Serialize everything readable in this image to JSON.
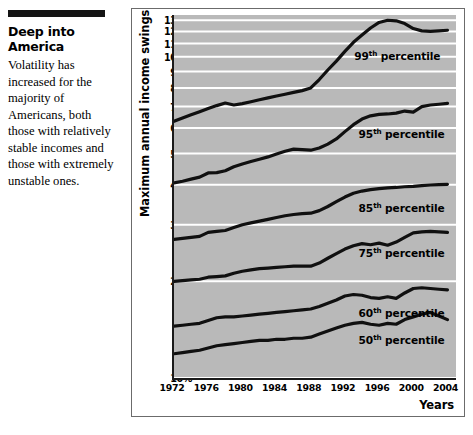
{
  "caption": {
    "heading": "Deep into America",
    "body": "Volatility has increased for the majority of Americans, both those with relatively stable incomes and those with extremely unstable ones."
  },
  "chart_data": {
    "type": "line",
    "title": "",
    "xlabel": "Years",
    "ylabel": "Maximum annual income swings",
    "yscale": "log",
    "ylim": [
      10,
      135
    ],
    "xlim": [
      1972,
      2005
    ],
    "grid": true,
    "legend_position": "inline-on-series",
    "plot_background": "#b9b9b9",
    "line_color": "#101010",
    "gridline_color": "#ffffff",
    "ytick_labels": [
      "130%",
      "120%",
      "110%",
      "100%",
      "90%",
      "80%",
      "70%",
      "60%",
      "50%",
      "40%",
      "30%",
      "20%",
      "10%"
    ],
    "ytick_values": [
      130,
      120,
      110,
      100,
      90,
      80,
      70,
      60,
      50,
      40,
      30,
      20,
      10
    ],
    "xtick_labels": [
      "1972",
      "1976",
      "1980",
      "1984",
      "1988",
      "1992",
      "1996",
      "2000",
      "2004"
    ],
    "xtick_values": [
      1972,
      1976,
      1980,
      1984,
      1988,
      1992,
      1996,
      2000,
      2004
    ],
    "x": [
      1972,
      1973,
      1974,
      1975,
      1976,
      1977,
      1978,
      1979,
      1980,
      1981,
      1982,
      1983,
      1984,
      1985,
      1986,
      1987,
      1988,
      1989,
      1990,
      1991,
      1992,
      1993,
      1994,
      1995,
      1996,
      1997,
      1998,
      1999,
      2000,
      2001,
      2002,
      2003,
      2004
    ],
    "series": [
      {
        "name": "99th percentile",
        "label": "99",
        "label_suffix": "th percentile",
        "label_x_year": 1993.1,
        "label_y_value": 101,
        "values": [
          63.0,
          64.5,
          66.0,
          67.5,
          69.0,
          70.5,
          71.8,
          70.8,
          71.5,
          72.5,
          73.5,
          74.5,
          75.5,
          76.5,
          77.5,
          78.5,
          80.0,
          85.0,
          91.0,
          97.0,
          104.0,
          111.0,
          117.0,
          123.0,
          128.0,
          130.0,
          129.5,
          127.0,
          122.5,
          120.5,
          120.0,
          120.5,
          121.0
        ]
      },
      {
        "name": "95th percentile",
        "label": "95",
        "label_suffix": "th percentile",
        "label_x_year": 1993.6,
        "label_y_value": 57.5,
        "values": [
          40.5,
          41.0,
          41.6,
          42.2,
          43.5,
          43.6,
          44.2,
          45.5,
          46.4,
          47.2,
          48.0,
          48.8,
          49.8,
          50.8,
          51.6,
          51.4,
          51.2,
          52.0,
          53.5,
          55.5,
          58.5,
          61.5,
          64.0,
          65.5,
          66.2,
          66.4,
          66.8,
          67.8,
          67.3,
          70.0,
          70.8,
          71.2,
          71.6
        ]
      },
      {
        "name": "85th percentile",
        "label": "85",
        "label_suffix": "th percentile",
        "label_x_year": 1993.6,
        "label_y_value": 33.8,
        "values": [
          27.0,
          27.2,
          27.4,
          27.6,
          28.4,
          28.6,
          28.8,
          29.4,
          30.0,
          30.4,
          30.8,
          31.2,
          31.6,
          32.0,
          32.3,
          32.5,
          32.6,
          33.2,
          34.2,
          35.4,
          36.6,
          37.6,
          38.2,
          38.6,
          38.9,
          39.1,
          39.2,
          39.4,
          39.5,
          39.7,
          39.9,
          40.0,
          40.1
        ]
      },
      {
        "name": "75th percentile",
        "label": "75",
        "label_suffix": "th percentile",
        "label_x_year": 1993.6,
        "label_y_value": 24.6,
        "values": [
          20.0,
          20.1,
          20.2,
          20.3,
          20.6,
          20.7,
          20.8,
          21.2,
          21.5,
          21.7,
          21.9,
          22.0,
          22.1,
          22.2,
          22.3,
          22.3,
          22.3,
          22.8,
          23.6,
          24.4,
          25.2,
          25.8,
          26.2,
          26.0,
          26.3,
          25.9,
          26.5,
          27.4,
          28.3,
          28.5,
          28.6,
          28.5,
          28.4
        ]
      },
      {
        "name": "60th percentile",
        "label": "60",
        "label_suffix": "th percentile",
        "label_x_year": 1993.6,
        "label_y_value": 15.9,
        "values": [
          14.5,
          14.6,
          14.7,
          14.8,
          15.1,
          15.4,
          15.5,
          15.5,
          15.6,
          15.7,
          15.8,
          15.9,
          16.0,
          16.1,
          16.2,
          16.3,
          16.4,
          16.7,
          17.1,
          17.5,
          18.0,
          18.2,
          18.1,
          17.8,
          17.7,
          17.9,
          17.7,
          18.4,
          19.0,
          19.1,
          19.0,
          18.9,
          18.8
        ]
      },
      {
        "name": "50th percentile",
        "label": "50",
        "label_suffix": "th percentile",
        "label_x_year": 1993.6,
        "label_y_value": 13.1,
        "values": [
          11.9,
          12.0,
          12.1,
          12.2,
          12.4,
          12.6,
          12.7,
          12.8,
          12.9,
          13.0,
          13.1,
          13.1,
          13.2,
          13.2,
          13.3,
          13.3,
          13.4,
          13.7,
          14.0,
          14.3,
          14.6,
          14.8,
          14.9,
          14.7,
          14.6,
          14.8,
          14.7,
          15.2,
          15.5,
          15.8,
          16.0,
          15.6,
          15.2
        ]
      }
    ]
  }
}
